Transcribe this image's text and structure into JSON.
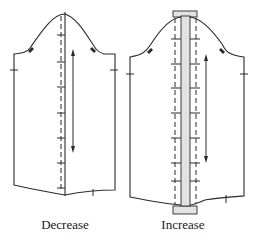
{
  "figure": {
    "panels": [
      {
        "id": "decrease",
        "caption": "Decrease",
        "description": "Sleeve pattern with a single fold line overlapped along the center to reduce width"
      },
      {
        "id": "increase",
        "caption": "Increase",
        "description": "Sleeve pattern split at center with a shaded insert strip spreading the halves to add width"
      }
    ],
    "colors": {
      "line": "#2a2a2a",
      "insert_fill": "#e2e2e2",
      "background": "#ffffff"
    }
  }
}
